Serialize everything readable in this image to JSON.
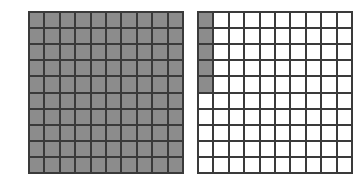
{
  "figure": {
    "shade_color": "#8c8c8c",
    "line_color": "#3a3a3a",
    "grids": [
      {
        "name": "left-grid",
        "rows": 10,
        "cols": 10,
        "shaded_cells": 100,
        "shading": "all cells shaded"
      },
      {
        "name": "right-grid",
        "rows": 10,
        "cols": 10,
        "shaded_cells": 5,
        "shading": "first column, top 5 rows shaded"
      }
    ]
  }
}
